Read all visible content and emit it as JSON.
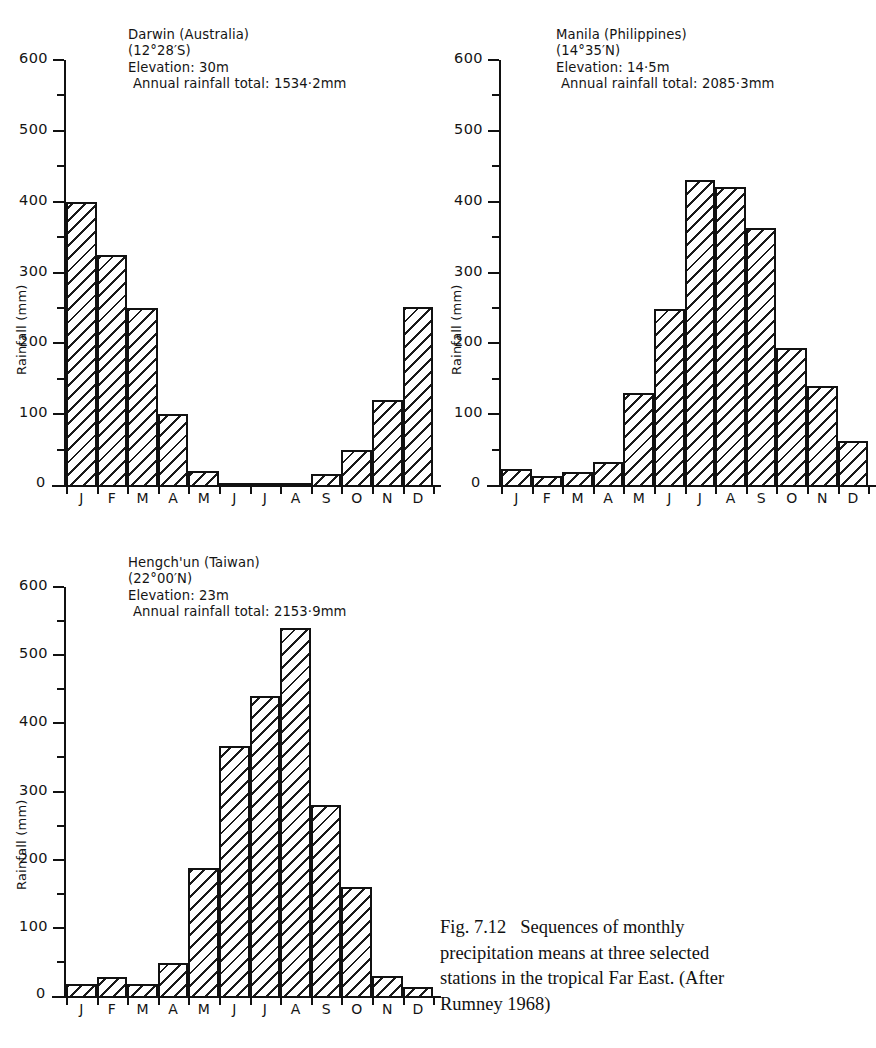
{
  "figure": {
    "caption_number": "Fig. 7.12",
    "caption_text": "Sequences of monthly precipitation means at three selected stations in the tropical Far East. (After Rumney 1968)",
    "caption_line1": "Fig. 7.12   Sequences of monthly",
    "caption_line2": "precipitation means at three selected",
    "caption_line3": "stations in the tropical Far East. (After",
    "caption_line4": "Rumney 1968)"
  },
  "axis": {
    "ylabel": "Rainfall (mm)",
    "ytick_labels": [
      "600",
      "500",
      "400",
      "300",
      "200",
      "100"
    ],
    "zero_label": "0",
    "ymin": 0,
    "ymax": 600,
    "major_step": 100,
    "minor_step": 50,
    "month_labels": [
      "J",
      "F",
      "M",
      "A",
      "M",
      "J",
      "J",
      "A",
      "S",
      "O",
      "N",
      "D"
    ]
  },
  "chart_data": [
    {
      "type": "bar",
      "id": "darwin",
      "title": "Darwin (Australia)",
      "coordinates": "(12°28′S)",
      "elevation": "Elevation: 30m",
      "annual_total": "Annual rainfall total: 1534·2mm",
      "categories": [
        "J",
        "F",
        "M",
        "A",
        "M",
        "J",
        "J",
        "A",
        "S",
        "O",
        "N",
        "D"
      ],
      "values": [
        400,
        325,
        250,
        100,
        20,
        2,
        1,
        2,
        15,
        50,
        120,
        252
      ],
      "xlabel": "",
      "ylabel": "Rainfall (mm)",
      "ylim": [
        0,
        600
      ],
      "grid": false,
      "legend": "none"
    },
    {
      "type": "bar",
      "id": "manila",
      "title": "Manila (Philippines)",
      "coordinates": "(14°35′N)",
      "elevation": "Elevation: 14·5m",
      "annual_total": "Annual rainfall total: 2085·3mm",
      "categories": [
        "J",
        "F",
        "M",
        "A",
        "M",
        "J",
        "J",
        "A",
        "S",
        "O",
        "N",
        "D"
      ],
      "values": [
        23,
        13,
        18,
        32,
        130,
        248,
        430,
        421,
        363,
        194,
        140,
        62
      ],
      "xlabel": "",
      "ylabel": "Rainfall (mm)",
      "ylim": [
        0,
        600
      ],
      "grid": false,
      "legend": "none"
    },
    {
      "type": "bar",
      "id": "hengchun",
      "title": "Hengch'un (Taiwan)",
      "coordinates": "(22°00′N)",
      "elevation": "Elevation: 23m",
      "annual_total": "Annual rainfall total: 2153·9mm",
      "categories": [
        "J",
        "F",
        "M",
        "A",
        "M",
        "J",
        "J",
        "A",
        "S",
        "O",
        "N",
        "D"
      ],
      "values": [
        18,
        28,
        18,
        48,
        188,
        367,
        440,
        540,
        280,
        160,
        30,
        13
      ],
      "xlabel": "",
      "ylabel": "Rainfall (mm)",
      "ylim": [
        0,
        600
      ],
      "grid": false,
      "legend": "none"
    }
  ]
}
